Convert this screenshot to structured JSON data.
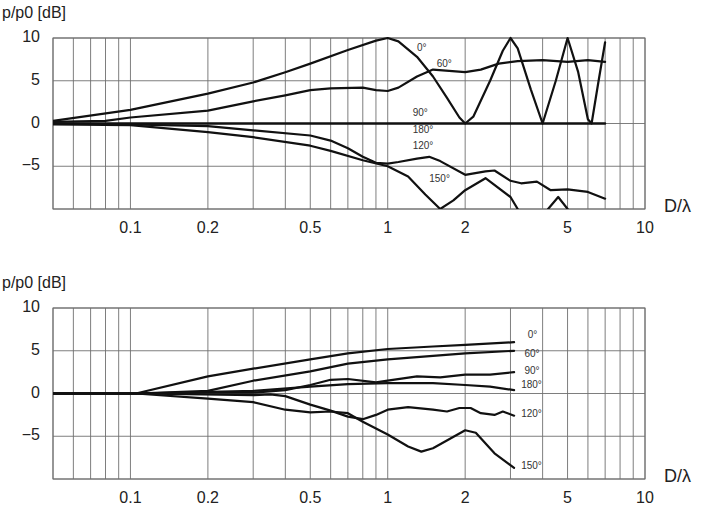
{
  "chart_data": [
    {
      "type": "line",
      "title": "",
      "ylabel": "p/p0 [dB]",
      "xlabel": "D/λ",
      "xscale": "log",
      "xlim": [
        0.05,
        10
      ],
      "ylim": [
        -10,
        10
      ],
      "yticks": [
        "10",
        "5",
        "0",
        "−5"
      ],
      "ytick_values": [
        10,
        5,
        0,
        -5
      ],
      "xticks": [
        "0.1",
        "0.2",
        "0.5",
        "1",
        "2",
        "5",
        "10"
      ],
      "xtick_values": [
        0.1,
        0.2,
        0.5,
        1,
        2,
        5,
        10
      ],
      "grid": true,
      "legend": "inline curve labels",
      "series": [
        {
          "name": "0°",
          "x": [
            0.05,
            0.1,
            0.2,
            0.3,
            0.4,
            0.5,
            0.7,
            0.9,
            1.0,
            1.1,
            1.3,
            1.5,
            1.7,
            1.9,
            2.0,
            2.15,
            2.5,
            2.8,
            3.0,
            3.2,
            3.6,
            4.0,
            4.5,
            5.0,
            5.5,
            6.0,
            6.2,
            6.6,
            7.0
          ],
          "y": [
            0.3,
            1.6,
            3.5,
            4.8,
            6,
            7,
            8.6,
            9.7,
            10,
            9.6,
            7.8,
            5.5,
            3,
            0.7,
            0,
            0.8,
            5,
            8.5,
            10,
            8.8,
            4,
            0,
            5,
            10,
            6,
            0.5,
            0,
            5,
            9.5
          ]
        },
        {
          "name": "60°",
          "x": [
            0.05,
            0.08,
            0.1,
            0.2,
            0.3,
            0.4,
            0.5,
            0.6,
            0.8,
            0.9,
            1.0,
            1.1,
            1.3,
            1.5,
            2.0,
            2.3,
            2.7,
            3.2,
            4.0,
            5.0,
            6.0,
            7.0
          ],
          "y": [
            0.2,
            0.3,
            0.7,
            1.5,
            2.6,
            3.3,
            3.9,
            4.1,
            4.2,
            3.9,
            3.8,
            4.2,
            5.5,
            6.3,
            6,
            6.3,
            7,
            7.3,
            7.4,
            7.2,
            7.4,
            7.2
          ]
        },
        {
          "name": "90°",
          "x": [
            0.05,
            7.0
          ],
          "y": [
            0,
            0
          ]
        },
        {
          "name": "180°",
          "x": [
            0.05,
            7.0
          ],
          "y": [
            0,
            0
          ]
        },
        {
          "name": "120°",
          "x": [
            0.05,
            0.1,
            0.2,
            0.3,
            0.5,
            0.6,
            0.7,
            0.8,
            0.9,
            1.0,
            1.1,
            1.3,
            1.45,
            1.6,
            2.0,
            2.4,
            2.6,
            3.0,
            3.3,
            3.8,
            4.3,
            5.0,
            6.0,
            7.0
          ],
          "y": [
            0,
            -0.1,
            -0.3,
            -0.8,
            -1.4,
            -2,
            -2.9,
            -3.9,
            -4.6,
            -4.7,
            -4.5,
            -4.1,
            -3.9,
            -4.4,
            -6,
            -5.6,
            -5.5,
            -6.7,
            -7,
            -6.8,
            -7.8,
            -7.7,
            -8,
            -8.8
          ]
        },
        {
          "name": "150°",
          "x": [
            0.05,
            0.1,
            0.2,
            0.3,
            0.5,
            0.6,
            0.8,
            1.0,
            1.2,
            1.4,
            1.6,
            1.8,
            2.0,
            2.4,
            3.0,
            3.2,
            null,
            4.2,
            4.6,
            5.0
          ],
          "y": [
            -0.1,
            -0.2,
            -1,
            -1.6,
            -2.6,
            -3.2,
            -4.3,
            -5,
            -6.2,
            -8.3,
            -10,
            -9,
            -7.8,
            -6.4,
            -8.6,
            -10,
            null,
            -10,
            -8.6,
            -10
          ]
        }
      ],
      "annotations": [
        {
          "text": "0°",
          "x": 1.3,
          "y": 8.8
        },
        {
          "text": "60°",
          "x": 1.55,
          "y": 7.0
        },
        {
          "text": "90°",
          "x": 1.25,
          "y": 1.2
        },
        {
          "text": "180°",
          "x": 1.25,
          "y": -0.8
        },
        {
          "text": "120°",
          "x": 1.25,
          "y": -2.6
        },
        {
          "text": "150°",
          "x": 1.45,
          "y": -6.5
        }
      ]
    },
    {
      "type": "line",
      "title": "",
      "ylabel": "p/p0 [dB]",
      "xlabel": "D/λ",
      "xscale": "log",
      "xlim": [
        0.05,
        10
      ],
      "ylim": [
        -10,
        10
      ],
      "yticks": [
        "10",
        "5",
        "0",
        "−5"
      ],
      "ytick_values": [
        10,
        5,
        0,
        -5
      ],
      "xticks": [
        "0.1",
        "0.2",
        "0.5",
        "1",
        "2",
        "5",
        "10"
      ],
      "xtick_values": [
        0.1,
        0.2,
        0.5,
        1,
        2,
        5,
        10
      ],
      "grid": true,
      "legend": "inline curve labels at right end",
      "series": [
        {
          "name": "0°",
          "x": [
            0.05,
            0.105,
            0.2,
            0.3,
            0.5,
            0.7,
            1,
            1.5,
            2,
            3.1
          ],
          "y": [
            0,
            0,
            2,
            2.9,
            4,
            4.7,
            5.2,
            5.5,
            5.7,
            6
          ]
        },
        {
          "name": "60°",
          "x": [
            0.05,
            0.105,
            0.2,
            0.3,
            0.5,
            0.7,
            1,
            1.5,
            2,
            3.1
          ],
          "y": [
            0,
            0,
            0.3,
            1.5,
            2.6,
            3.5,
            4,
            4.4,
            4.7,
            5
          ]
        },
        {
          "name": "90°",
          "x": [
            0.05,
            0.105,
            0.2,
            0.3,
            0.4,
            0.5,
            0.6,
            0.7,
            0.9,
            1.0,
            1.3,
            1.6,
            2,
            2.5,
            3.1
          ],
          "y": [
            0,
            0,
            0.1,
            0.1,
            0.4,
            1,
            1.6,
            1.7,
            1.3,
            1.5,
            2.0,
            1.9,
            2.2,
            2.2,
            2.5
          ]
        },
        {
          "name": "180°",
          "x": [
            0.05,
            0.105,
            0.3,
            0.5,
            0.7,
            1,
            1.5,
            2,
            2.5,
            3.1
          ],
          "y": [
            0,
            0,
            0.3,
            0.8,
            1.1,
            1.2,
            1.2,
            1,
            0.8,
            0.4
          ]
        },
        {
          "name": "120°",
          "x": [
            0.05,
            0.105,
            0.3,
            0.35,
            0.4,
            0.5,
            0.6,
            0.7,
            0.8,
            0.9,
            1.0,
            1.2,
            1.5,
            1.7,
            1.9,
            2.1,
            2.3,
            2.6,
            2.8,
            3.1
          ],
          "y": [
            0,
            0,
            -0.2,
            -0.1,
            -0.3,
            -1.3,
            -2,
            -2.7,
            -3,
            -2.5,
            -1.9,
            -1.6,
            -1.9,
            -2.1,
            -1.7,
            -1.7,
            -2.3,
            -2.5,
            -2.1,
            -2.6
          ]
        },
        {
          "name": "150°",
          "x": [
            0.05,
            0.105,
            0.2,
            0.3,
            0.4,
            0.5,
            0.6,
            0.7,
            0.8,
            1.0,
            1.2,
            1.35,
            1.5,
            2.0,
            2.2,
            2.6,
            3.1
          ],
          "y": [
            0,
            0,
            -0.6,
            -1.0,
            -1.9,
            -2.2,
            -2.1,
            -2.3,
            -3.3,
            -4.8,
            -6.2,
            -6.8,
            -6.4,
            -4.3,
            -4.6,
            -7,
            -8.7
          ]
        }
      ],
      "annotations": [
        {
          "text": "0°",
          "x": 3.5,
          "y": 6.8
        },
        {
          "text": "60°",
          "x": 3.4,
          "y": 4.6
        },
        {
          "text": "90°",
          "x": 3.4,
          "y": 2.6
        },
        {
          "text": "180°",
          "x": 3.3,
          "y": 1.0
        },
        {
          "text": "120°",
          "x": 3.3,
          "y": -2.4
        },
        {
          "text": "150°",
          "x": 3.3,
          "y": -8.5
        }
      ]
    }
  ]
}
